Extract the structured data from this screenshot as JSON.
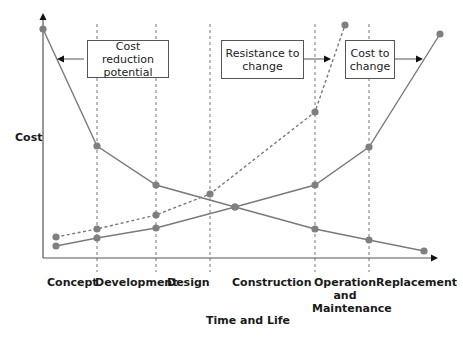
{
  "chart_data": {
    "type": "line",
    "title": "",
    "xlabel": "Time and Life",
    "ylabel": "Cost",
    "grid": false,
    "phases": [
      "Concept",
      "Development",
      "Design",
      "Construction",
      "Operation and Maintenance",
      "Replacement"
    ],
    "phase_boundaries_px": [
      97,
      156,
      210,
      315,
      369
    ],
    "series": [
      {
        "name": "Cost reduction potential",
        "style": "solid",
        "points": [
          [
            43,
            29
          ],
          [
            97,
            146
          ],
          [
            156,
            185
          ],
          [
            235,
            207
          ],
          [
            315,
            229
          ],
          [
            369,
            240
          ],
          [
            424,
            251
          ]
        ]
      },
      {
        "name": "Cost to change",
        "style": "solid",
        "points": [
          [
            56,
            246
          ],
          [
            97,
            238
          ],
          [
            156,
            228
          ],
          [
            235,
            207
          ],
          [
            315,
            185
          ],
          [
            369,
            147
          ],
          [
            440,
            34
          ]
        ]
      },
      {
        "name": "Resistance to change",
        "style": "dashed",
        "points": [
          [
            56,
            237
          ],
          [
            97,
            229
          ],
          [
            156,
            215
          ],
          [
            210,
            194
          ],
          [
            315,
            112
          ],
          [
            345,
            25
          ]
        ]
      }
    ],
    "annotations": [
      {
        "text": "Cost reduction potential",
        "arrow": "left"
      },
      {
        "text": "Resistance to change",
        "arrow": "right"
      },
      {
        "text": "Cost to change",
        "arrow": "right"
      }
    ]
  },
  "labels": {
    "y_axis": "Cost",
    "x_axis": "Time and Life",
    "phase_concept": "Concept",
    "phase_development": "Development",
    "phase_design": "Design",
    "phase_construction": "Construction",
    "phase_operation_1": "Operation",
    "phase_operation_2": "and",
    "phase_operation_3": "Maintenance",
    "phase_replacement": "Replacement"
  },
  "callouts": {
    "cost_reduction_1": "Cost reduction",
    "cost_reduction_2": "potential",
    "resistance_1": "Resistance to",
    "resistance_2": "change",
    "cost_change_1": "Cost to",
    "cost_change_2": "change"
  },
  "colors": {
    "line": "#7a7a7a",
    "marker": "#7f7f7f",
    "axis": "#555555",
    "guide": "#666666"
  }
}
